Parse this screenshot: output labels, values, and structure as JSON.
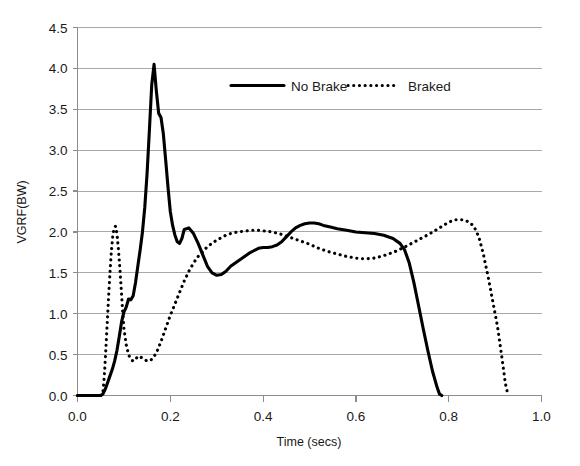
{
  "chart_data": {
    "type": "line",
    "title": "",
    "xlabel": "Time (secs)",
    "ylabel": "VGRF(BW)",
    "xlim": [
      0.0,
      1.0
    ],
    "ylim": [
      0.0,
      4.5
    ],
    "xticks": [
      "0.0",
      "0.2",
      "0.4",
      "0.6",
      "0.8",
      "1.0"
    ],
    "xtick_values": [
      0.0,
      0.2,
      0.4,
      0.6,
      0.8,
      1.0
    ],
    "yticks": [
      "0.0",
      "0.5",
      "1.0",
      "1.5",
      "2.0",
      "2.5",
      "3.0",
      "3.5",
      "4.0",
      "4.5"
    ],
    "ytick_values": [
      0.0,
      0.5,
      1.0,
      1.5,
      2.0,
      2.5,
      3.0,
      3.5,
      4.0,
      4.5
    ],
    "grid": "horizontal",
    "legend_position": "top-center",
    "series": [
      {
        "name": "No Brake",
        "style": "solid",
        "color": "#000000",
        "x": [
          0.0,
          0.02,
          0.04,
          0.05,
          0.055,
          0.06,
          0.065,
          0.07,
          0.075,
          0.08,
          0.085,
          0.09,
          0.095,
          0.1,
          0.105,
          0.11,
          0.115,
          0.12,
          0.125,
          0.13,
          0.135,
          0.14,
          0.145,
          0.15,
          0.155,
          0.16,
          0.165,
          0.17,
          0.175,
          0.18,
          0.185,
          0.19,
          0.195,
          0.2,
          0.205,
          0.21,
          0.215,
          0.22,
          0.225,
          0.23,
          0.24,
          0.25,
          0.26,
          0.27,
          0.28,
          0.29,
          0.3,
          0.31,
          0.32,
          0.33,
          0.34,
          0.35,
          0.36,
          0.37,
          0.38,
          0.39,
          0.4,
          0.41,
          0.42,
          0.43,
          0.44,
          0.45,
          0.46,
          0.47,
          0.48,
          0.49,
          0.5,
          0.51,
          0.52,
          0.53,
          0.545,
          0.56,
          0.58,
          0.6,
          0.62,
          0.64,
          0.66,
          0.68,
          0.695,
          0.705,
          0.715,
          0.725,
          0.735,
          0.745,
          0.755,
          0.765,
          0.775,
          0.78,
          0.785
        ],
        "y": [
          0.0,
          0.0,
          0.0,
          0.0,
          0.02,
          0.08,
          0.16,
          0.24,
          0.32,
          0.42,
          0.55,
          0.72,
          0.9,
          1.02,
          1.08,
          1.18,
          1.17,
          1.22,
          1.38,
          1.58,
          1.78,
          2.0,
          2.3,
          2.72,
          3.25,
          3.8,
          4.05,
          3.72,
          3.45,
          3.4,
          3.2,
          2.88,
          2.55,
          2.25,
          2.08,
          1.96,
          1.88,
          1.86,
          1.92,
          2.03,
          2.05,
          1.98,
          1.86,
          1.72,
          1.58,
          1.5,
          1.47,
          1.48,
          1.52,
          1.58,
          1.62,
          1.66,
          1.7,
          1.74,
          1.77,
          1.8,
          1.81,
          1.81,
          1.82,
          1.84,
          1.88,
          1.94,
          2.0,
          2.05,
          2.08,
          2.1,
          2.11,
          2.11,
          2.1,
          2.08,
          2.06,
          2.04,
          2.02,
          2.0,
          1.99,
          1.98,
          1.96,
          1.92,
          1.86,
          1.78,
          1.62,
          1.38,
          1.1,
          0.82,
          0.55,
          0.3,
          0.1,
          0.02,
          0.0
        ]
      },
      {
        "name": "Braked",
        "style": "dotted",
        "color": "#000000",
        "x": [
          0.0,
          0.02,
          0.04,
          0.05,
          0.055,
          0.058,
          0.061,
          0.064,
          0.067,
          0.07,
          0.073,
          0.076,
          0.079,
          0.082,
          0.085,
          0.088,
          0.091,
          0.094,
          0.097,
          0.1,
          0.105,
          0.11,
          0.115,
          0.12,
          0.125,
          0.13,
          0.14,
          0.15,
          0.16,
          0.17,
          0.18,
          0.19,
          0.2,
          0.21,
          0.22,
          0.23,
          0.24,
          0.25,
          0.26,
          0.27,
          0.28,
          0.29,
          0.3,
          0.31,
          0.32,
          0.33,
          0.345,
          0.36,
          0.375,
          0.39,
          0.405,
          0.42,
          0.44,
          0.46,
          0.48,
          0.5,
          0.52,
          0.54,
          0.56,
          0.58,
          0.6,
          0.62,
          0.64,
          0.66,
          0.68,
          0.7,
          0.72,
          0.74,
          0.76,
          0.78,
          0.8,
          0.815,
          0.83,
          0.845,
          0.855,
          0.865,
          0.875,
          0.885,
          0.895,
          0.905,
          0.915,
          0.922,
          0.928
        ],
        "y": [
          0.0,
          0.0,
          0.0,
          0.0,
          0.05,
          0.25,
          0.55,
          0.88,
          1.2,
          1.5,
          1.76,
          1.95,
          2.05,
          2.07,
          1.98,
          1.8,
          1.58,
          1.32,
          1.05,
          0.82,
          0.62,
          0.5,
          0.44,
          0.42,
          0.44,
          0.48,
          0.46,
          0.42,
          0.44,
          0.52,
          0.66,
          0.82,
          0.98,
          1.12,
          1.26,
          1.4,
          1.52,
          1.62,
          1.7,
          1.76,
          1.82,
          1.86,
          1.9,
          1.93,
          1.96,
          1.98,
          2.0,
          2.01,
          2.02,
          2.02,
          2.01,
          2.0,
          1.97,
          1.93,
          1.89,
          1.85,
          1.8,
          1.76,
          1.73,
          1.7,
          1.68,
          1.67,
          1.68,
          1.71,
          1.75,
          1.8,
          1.86,
          1.92,
          1.98,
          2.05,
          2.12,
          2.15,
          2.15,
          2.12,
          2.06,
          1.94,
          1.72,
          1.45,
          1.15,
          0.85,
          0.45,
          0.15,
          0.0
        ]
      }
    ]
  },
  "legend": {
    "entries": [
      {
        "label": "No Brake",
        "style": "solid"
      },
      {
        "label": "Braked",
        "style": "dotted"
      }
    ]
  },
  "axes": {
    "y_title": "VGRF(BW)",
    "x_title": "Time (secs)"
  }
}
